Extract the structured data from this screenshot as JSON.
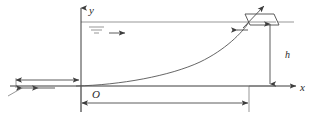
{
  "figure": {
    "background_color": "#ffffff",
    "line_color": "#4a4a4a",
    "curve_color": "#555555",
    "text_color": "#2a2a2a",
    "labels": {
      "y_axis": "y",
      "x_axis": "x",
      "origin": "O",
      "depth": "h"
    },
    "icons": {
      "water_surface": "water-level-icon",
      "flow_direction": "flow-arrow-icon",
      "boat": "boat-icon",
      "tow_direction": "tow-arrow-icon"
    },
    "geometry": {
      "origin_px": {
        "x": 81,
        "y": 86
      },
      "water_line_y_px": 22,
      "boat_x_px": 249,
      "x_axis_end_px": 294,
      "y_axis_top_px": 6,
      "depth_dimension_x_px": 270,
      "bottom_dimension_y_px": 103,
      "left_dimension_y_px": 80,
      "pull_arrows_y_px": 88
    },
    "curve_description": "tractrix rising from near origin to boat at water surface"
  }
}
